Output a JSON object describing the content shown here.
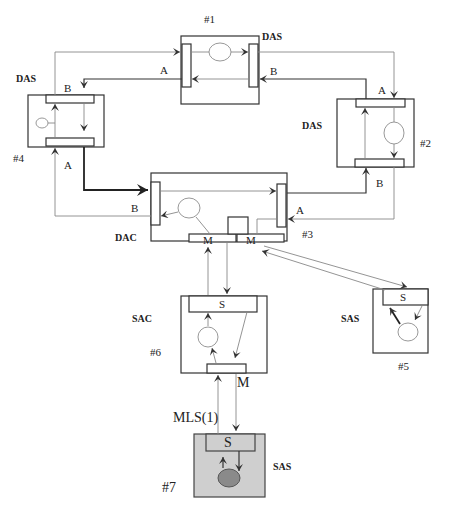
{
  "diagram": {
    "type": "FDDI network topology",
    "stations": [
      {
        "id": "#1",
        "label": "#1",
        "type": "DAS",
        "ports": [
          "A",
          "B"
        ]
      },
      {
        "id": "#2",
        "label": "#2",
        "type": "DAS",
        "ports": [
          "A",
          "B"
        ]
      },
      {
        "id": "#3",
        "label": "#3",
        "type": "DAC",
        "ports": [
          "A",
          "B",
          "M",
          "M"
        ]
      },
      {
        "id": "#4",
        "label": "#4",
        "type": "DAS",
        "ports": [
          "A",
          "B"
        ]
      },
      {
        "id": "#5",
        "label": "#5",
        "type": "SAS",
        "ports": [
          "S"
        ]
      },
      {
        "id": "#6",
        "label": "#6",
        "type": "SAC",
        "ports": [
          "S",
          "M"
        ]
      },
      {
        "id": "#7",
        "label": "#7",
        "type": "SAS",
        "ports": [
          "S"
        ],
        "highlighted": true
      }
    ],
    "link_label": "MLS(1)",
    "colors": {
      "line": "#333333",
      "thin_line": "#888888",
      "highlight_fill": "#cfcfcf",
      "highlight_circle": "#8a8a8a"
    }
  },
  "labels": {
    "n1": "#1",
    "n2": "#2",
    "n3": "#3",
    "n4": "#4",
    "n5": "#5",
    "n6": "#6",
    "n7": "#7",
    "das1": "DAS",
    "das2": "DAS",
    "das4": "DAS",
    "dac3": "DAC",
    "sas5": "SAS",
    "sac6": "SAC",
    "sas7": "SAS",
    "port_a1": "A",
    "port_b1": "B",
    "port_a2": "A",
    "port_b2": "B",
    "port_a3": "A",
    "port_b3": "B",
    "port_a4": "A",
    "port_b4": "B",
    "m3a": "M",
    "m3b": "M",
    "s5": "S",
    "s6": "S",
    "m6": "M",
    "s7": "S",
    "mls": "MLS(1)"
  }
}
